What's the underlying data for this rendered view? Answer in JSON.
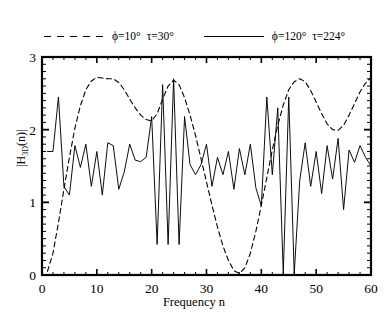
{
  "figure": {
    "domain": "chart",
    "background": "#ffffff",
    "line_color": "#000000"
  },
  "axes": {
    "xlabel": "Frequency  n",
    "ylabel_html": "|H<sub>3D</sub>(n)|",
    "ylabel_plain": "|H_3D(n)|",
    "x_ticks": [
      "0",
      "10",
      "20",
      "30",
      "40",
      "50",
      "60"
    ],
    "y_ticks": [
      "0",
      "1",
      "2",
      "3"
    ],
    "x_minor_step": 2,
    "y_minor_step": 0.1,
    "grid": false
  },
  "legend": {
    "position": "top-inside",
    "entries": [
      {
        "style": "dashed",
        "label": "ϕ=10°",
        "label2": "τ=30°"
      },
      {
        "style": "solid",
        "label": "ϕ=120°",
        "label2": "τ=224°"
      }
    ]
  },
  "chart_data": {
    "type": "line",
    "title": "",
    "xlabel": "Frequency  n",
    "ylabel": "|H_3D(n)|",
    "xlim": [
      0,
      60
    ],
    "ylim": [
      0,
      3
    ],
    "xticks": [
      0,
      10,
      20,
      30,
      40,
      50,
      60
    ],
    "yticks": [
      0,
      1,
      2,
      3
    ],
    "grid": false,
    "legend_position": "upper-center-inside",
    "x": [
      1,
      2,
      3,
      4,
      5,
      6,
      7,
      8,
      9,
      10,
      11,
      12,
      13,
      14,
      15,
      16,
      17,
      18,
      19,
      20,
      21,
      22,
      23,
      24,
      25,
      26,
      27,
      28,
      29,
      30,
      31,
      32,
      33,
      34,
      35,
      36,
      37,
      38,
      39,
      40,
      41,
      42,
      43,
      44,
      45,
      46,
      47,
      48,
      49,
      50,
      51,
      52,
      53,
      54,
      55,
      56,
      57,
      58,
      59,
      60
    ],
    "series": [
      {
        "name": "ϕ=10°  τ=30°",
        "style": "dashed",
        "color": "#000000",
        "values": [
          0.05,
          0.3,
          0.72,
          1.18,
          1.62,
          2.02,
          2.33,
          2.55,
          2.67,
          2.72,
          2.71,
          2.7,
          2.7,
          2.65,
          2.55,
          2.42,
          2.3,
          2.2,
          2.14,
          2.12,
          2.22,
          2.42,
          2.6,
          2.68,
          2.62,
          2.44,
          2.2,
          1.92,
          1.6,
          1.28,
          0.96,
          0.66,
          0.4,
          0.2,
          0.06,
          0.02,
          0.1,
          0.3,
          0.6,
          0.96,
          1.34,
          1.72,
          2.06,
          2.34,
          2.55,
          2.66,
          2.7,
          2.66,
          2.54,
          2.38,
          2.22,
          2.08,
          2.0,
          1.99,
          2.06,
          2.2,
          2.36,
          2.52,
          2.64,
          2.72
        ]
      },
      {
        "name": "ϕ=120°  τ=224°",
        "style": "solid",
        "color": "#000000",
        "values": [
          1.7,
          1.7,
          2.45,
          1.22,
          1.1,
          1.78,
          1.48,
          1.8,
          1.22,
          1.7,
          1.1,
          1.82,
          1.78,
          1.18,
          1.42,
          1.8,
          1.58,
          1.56,
          1.62,
          2.18,
          0.42,
          2.62,
          0.42,
          2.7,
          0.42,
          2.18,
          1.52,
          1.38,
          1.52,
          1.8,
          1.22,
          1.62,
          1.38,
          1.7,
          1.18,
          1.74,
          1.38,
          1.8,
          1.2,
          0.95,
          2.45,
          1.38,
          2.3,
          0.02,
          2.45,
          0.02,
          1.3,
          1.82,
          1.22,
          1.7,
          1.12,
          1.78,
          1.32,
          1.88,
          0.9,
          1.72,
          1.55,
          1.78,
          1.62,
          1.5
        ]
      }
    ]
  }
}
